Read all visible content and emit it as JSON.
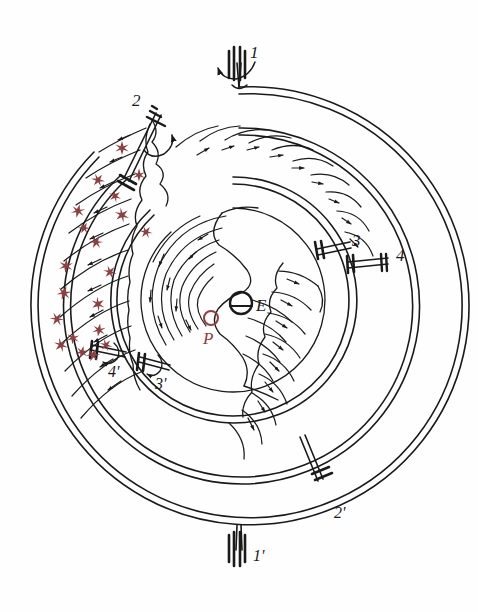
{
  "figure": {
    "background_color": "#fefefe",
    "ink_color": "#1a1a1a",
    "accent_color": "#8b4042",
    "width": 478,
    "height": 612
  },
  "callouts": [
    {
      "id": "c1",
      "text": "1",
      "x": 250,
      "y": 44,
      "size": "sz-lg"
    },
    {
      "id": "c2",
      "text": "2",
      "x": 132,
      "y": 92,
      "size": "sz-lg"
    },
    {
      "id": "c3",
      "text": "3",
      "x": 352,
      "y": 232,
      "size": "sz-lg"
    },
    {
      "id": "c4",
      "text": "4",
      "x": 396,
      "y": 247,
      "size": "sz-lg"
    },
    {
      "id": "c4p",
      "text": "4'",
      "x": 108,
      "y": 364,
      "size": "sz-md"
    },
    {
      "id": "c3p",
      "text": "3'",
      "x": 155,
      "y": 376,
      "size": "sz-md"
    },
    {
      "id": "c2p",
      "text": "2'",
      "x": 334,
      "y": 505,
      "size": "sz-md"
    },
    {
      "id": "c1p",
      "text": "1'",
      "x": 253,
      "y": 548,
      "size": "sz-md"
    }
  ],
  "core_labels": [
    {
      "id": "lblE",
      "text": "E",
      "x": 256,
      "y": 297,
      "accent": false
    },
    {
      "id": "lblP",
      "text": "P",
      "x": 203,
      "y": 330,
      "accent": true
    }
  ],
  "markers": {
    "evaporator_circle": {
      "cx": 241,
      "cy": 303,
      "r": 11,
      "color": "#1a1a1a"
    },
    "pump_circle": {
      "cx": 211,
      "cy": 318,
      "r": 7,
      "color": "#8b4042"
    }
  },
  "stars": {
    "symbol": "six-point-star",
    "color": "#8b4042",
    "count": 20,
    "points": [
      {
        "x": 122,
        "y": 148,
        "s": 7.0
      },
      {
        "x": 98,
        "y": 180,
        "s": 6.6
      },
      {
        "x": 78,
        "y": 211,
        "s": 6.9
      },
      {
        "x": 122,
        "y": 215,
        "s": 7.2
      },
      {
        "x": 96,
        "y": 242,
        "s": 6.7
      },
      {
        "x": 66,
        "y": 266,
        "s": 7.0
      },
      {
        "x": 110,
        "y": 272,
        "s": 6.5
      },
      {
        "x": 64,
        "y": 293,
        "s": 7.1
      },
      {
        "x": 98,
        "y": 304,
        "s": 6.8
      },
      {
        "x": 57,
        "y": 319,
        "s": 6.9
      },
      {
        "x": 99,
        "y": 330,
        "s": 6.6
      },
      {
        "x": 61,
        "y": 345,
        "s": 7.0
      },
      {
        "x": 93,
        "y": 355,
        "s": 6.8
      },
      {
        "x": 139,
        "y": 175,
        "s": 6.4
      },
      {
        "x": 146,
        "y": 232,
        "s": 6.3
      },
      {
        "x": 82,
        "y": 352,
        "s": 6.2
      },
      {
        "x": 115,
        "y": 196,
        "s": 6.1
      },
      {
        "x": 84,
        "y": 228,
        "s": 6.0
      },
      {
        "x": 73,
        "y": 338,
        "s": 6.3
      },
      {
        "x": 106,
        "y": 345,
        "s": 6.1
      }
    ]
  },
  "rings": {
    "outer_ring_1": {
      "cx": 239,
      "cy": 306,
      "r": 219,
      "label": "outermost-casing"
    },
    "outer_ring_2": {
      "cx": 239,
      "cy": 306,
      "r": 212,
      "label": "outer-casing-inner-wall"
    },
    "mid_ring_1": {
      "cx": 239,
      "cy": 306,
      "r": 178,
      "label": "second-casing-outer"
    },
    "mid_ring_2": {
      "cx": 239,
      "cy": 306,
      "r": 171,
      "label": "second-casing-inner"
    },
    "inner_ring_1": {
      "cx": 233,
      "cy": 300,
      "r": 123,
      "label": "inner-drum-outer"
    },
    "inner_ring_2": {
      "cx": 233,
      "cy": 300,
      "r": 116,
      "label": "inner-drum-inner"
    },
    "core": {
      "cx": 233,
      "cy": 300,
      "r": 92,
      "label": "core-cavity"
    }
  },
  "shafts": [
    {
      "id": "s1",
      "name": "top-vertical-shaft",
      "angle": -90,
      "rotation_arrow": true
    },
    {
      "id": "s1p",
      "name": "bottom-vertical-shaft",
      "angle": 90,
      "rotation_arrow": false
    },
    {
      "id": "s2",
      "name": "upper-left-radial-shaft",
      "angle": -118,
      "rotation_arrow": true
    },
    {
      "id": "s2p",
      "name": "lower-right-radial-shaft",
      "angle": 62,
      "rotation_arrow": false
    },
    {
      "id": "s3",
      "name": "right-inner-spoke",
      "angle": -18,
      "rotation_arrow": false
    },
    {
      "id": "s4",
      "name": "right-outer-spoke",
      "angle": -6,
      "rotation_arrow": false
    },
    {
      "id": "s3p",
      "name": "lower-left-inner-spoke",
      "angle": 162,
      "rotation_arrow": true
    },
    {
      "id": "s4p",
      "name": "lower-left-outer-spoke",
      "angle": 174,
      "rotation_arrow": true
    }
  ]
}
